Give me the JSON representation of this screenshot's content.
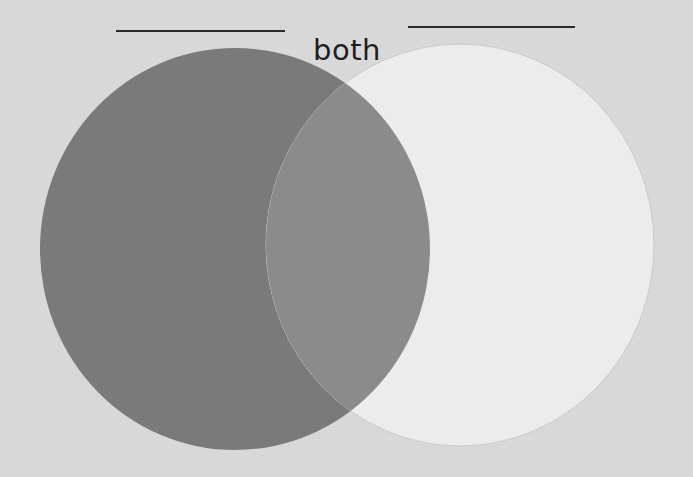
{
  "diagram": {
    "type": "venn",
    "title_blanks": {
      "left": {
        "x1": 116,
        "x2": 285,
        "y": 31
      },
      "right": {
        "x1": 408,
        "x2": 575,
        "y": 27
      }
    },
    "labels": {
      "intersection": "both"
    },
    "sets": [
      {
        "name": "left-set",
        "label": "",
        "cx": 235,
        "cy": 249,
        "rx": 195,
        "ry": 201,
        "color": "#7a7a7a"
      },
      {
        "name": "right-set",
        "label": "",
        "cx": 460,
        "cy": 245,
        "rx": 194,
        "ry": 201,
        "color": "#ececec"
      }
    ],
    "overlap_color": "#8b8b8b",
    "background_color": "#d8d8d8",
    "line_color": "#2a2a2a"
  }
}
